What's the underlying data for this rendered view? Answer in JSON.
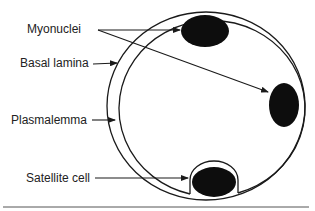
{
  "diagram": {
    "labels": {
      "myonuclei": "Myonuclei",
      "basal_lamina": "Basal lamina",
      "plasmalemma": "Plasmalemma",
      "satellite_cell": "Satellite cell"
    },
    "colors": {
      "line": "#1a1a1a",
      "nucleus": "#0d0d0d",
      "baseline": "#555555"
    }
  }
}
